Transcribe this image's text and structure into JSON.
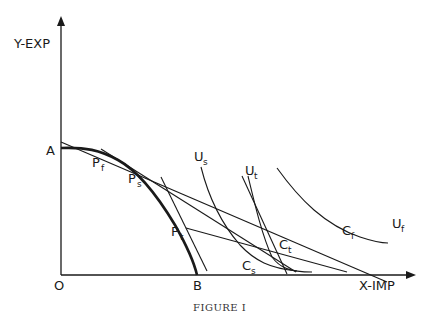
{
  "figure": {
    "caption": "Figure I",
    "caption_display": "FIGURE I",
    "axes": {
      "y_label": "Y-EXP",
      "x_label": "X-IMP",
      "origin_label": "O"
    },
    "frontier": {
      "intercept_y_label": "A",
      "intercept_x_label": "B"
    },
    "production_points": [
      {
        "main": "P",
        "sub": "f"
      },
      {
        "main": "P",
        "sub": "s"
      },
      {
        "main": "P",
        "sub": "t"
      }
    ],
    "consumption_points": [
      {
        "main": "C",
        "sub": "f"
      },
      {
        "main": "C",
        "sub": "s"
      },
      {
        "main": "C",
        "sub": "t"
      }
    ],
    "indifference_curves": [
      {
        "main": "U",
        "sub": "s"
      },
      {
        "main": "U",
        "sub": "t"
      },
      {
        "main": "U",
        "sub": "f"
      }
    ],
    "colors": {
      "ink": "#1a1a1a",
      "background": "#ffffff"
    }
  }
}
